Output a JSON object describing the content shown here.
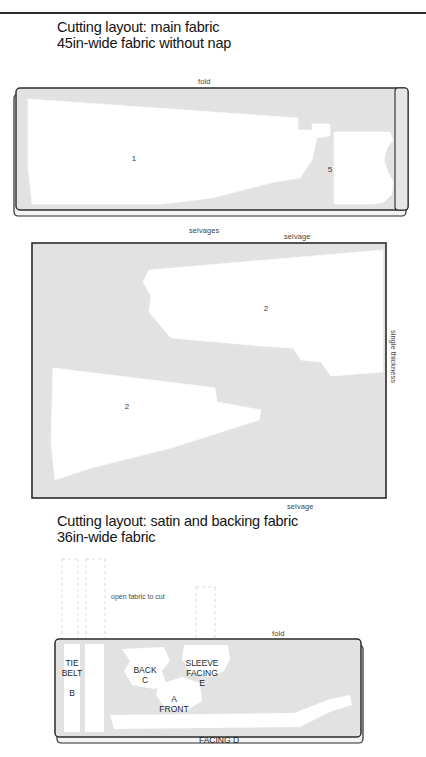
{
  "page": {
    "running_head": "",
    "colors": {
      "fabric_gray": "#e2e2e2",
      "fabric_gray_light": "#e8e8e8",
      "piece_white": "#ffffff",
      "outline": "#2b2b2b",
      "text": "#131313",
      "label_gray": "#444444",
      "dashed_guide": "#d6d6d6"
    }
  },
  "sections": [
    {
      "id": "main-fabric",
      "title_line1": "Cutting layout: main fabric",
      "title_line2": "45in-wide fabric without nap",
      "layouts": [
        {
          "id": "layout-45-folded",
          "fold_label": "fold",
          "bottom_label": "selvages",
          "pieces": [
            {
              "number": "1",
              "x": 134,
              "y": 158
            },
            {
              "number": "5",
              "x": 330,
              "y": 169
            }
          ]
        },
        {
          "id": "layout-45-single",
          "top_label": "selvage",
          "bottom_label": "selvage",
          "side_label": "single thickness",
          "pieces": [
            {
              "number": "2",
              "x": 266,
              "y": 308
            },
            {
              "number": "2",
              "x": 127,
              "y": 406
            }
          ]
        }
      ]
    },
    {
      "id": "satin-backing",
      "title_line1": "Cutting layout: satin and backing fabric",
      "title_line2": "36in-wide fabric",
      "note": "open fabric to cut",
      "layouts": [
        {
          "id": "layout-36-folded",
          "fold_label": "fold",
          "pieces": [
            {
              "label": "TIE\nBELT\n\nB",
              "lines": [
                "TIE",
                "BELT",
                "",
                "B"
              ],
              "x": 72,
              "y": 678
            },
            {
              "lines": [
                "BACK",
                "C"
              ],
              "x": 145,
              "y": 675
            },
            {
              "lines": [
                "SLEEVE",
                "FACING",
                "E"
              ],
              "x": 202,
              "y": 673
            },
            {
              "lines": [
                "A",
                "FRONT"
              ],
              "x": 174,
              "y": 704
            },
            {
              "lines": [
                "FACING  D"
              ],
              "x": 219,
              "y": 740
            }
          ]
        }
      ]
    }
  ]
}
